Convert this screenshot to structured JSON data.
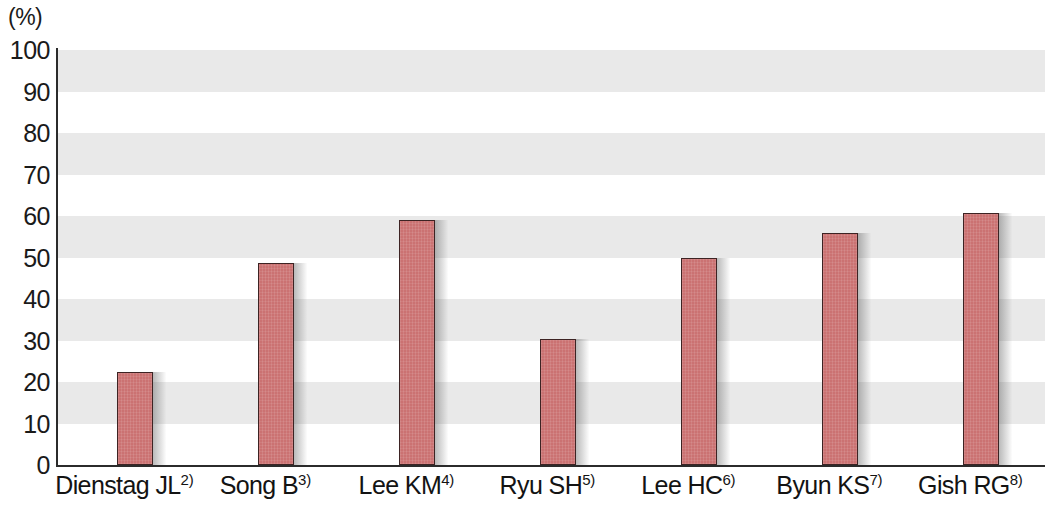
{
  "chart_data": {
    "type": "bar",
    "title": "",
    "subtitle": "",
    "xlabel": "",
    "ylabel": "(%)",
    "unit_label": "(%)",
    "ylim": [
      0,
      100
    ],
    "ytick_step": 10,
    "yticks": [
      "100",
      "90",
      "80",
      "70",
      "60",
      "50",
      "40",
      "30",
      "20",
      "10",
      "0"
    ],
    "grid": "alternating-horizontal-bands",
    "grid_band_color": "#e9e9e9",
    "band_ranges": [
      [
        90,
        100
      ],
      [
        70,
        80
      ],
      [
        50,
        60
      ],
      [
        30,
        40
      ],
      [
        10,
        20
      ]
    ],
    "legend": "none",
    "bar_color": "#cb7272",
    "bar_border_color": "#3d2323",
    "axis_color": "#2b2b2b",
    "categories": [
      "Dienstag JL",
      "Song B",
      "Lee KM",
      "Ryu SH",
      "Lee HC",
      "Byun KS",
      "Gish RG"
    ],
    "category_refs": [
      "2)",
      "3)",
      "4)",
      "5)",
      "6)",
      "7)",
      "8)"
    ],
    "values": [
      22.4,
      48.7,
      59.0,
      30.4,
      50.0,
      55.8,
      60.8
    ]
  }
}
